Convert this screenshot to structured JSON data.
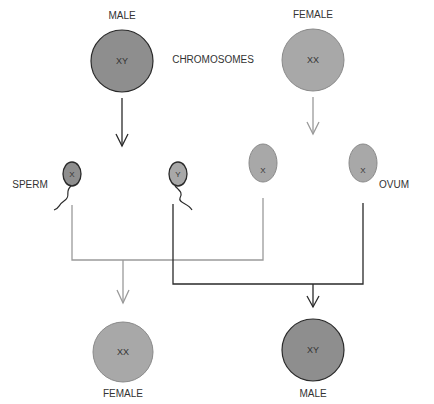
{
  "labels": {
    "male_parent": "MALE",
    "female_parent": "FEMALE",
    "chromosomes": "CHROMOSOMES",
    "sperm": "SPERM",
    "ovum": "OVUM",
    "female_offspring": "FEMALE",
    "male_offspring": "MALE"
  },
  "cells": {
    "male_parent": "XY",
    "female_parent": "XX",
    "sperm_x": "X",
    "sperm_y": "Y",
    "ovum_1": "X",
    "ovum_2": "X",
    "female_offspring": "XX",
    "male_offspring": "XY"
  },
  "colors": {
    "male_fill": "#8e8e8e",
    "female_fill": "#a8a8a8",
    "male_line": "#2a2a2a",
    "female_line": "#9a9a9a"
  }
}
